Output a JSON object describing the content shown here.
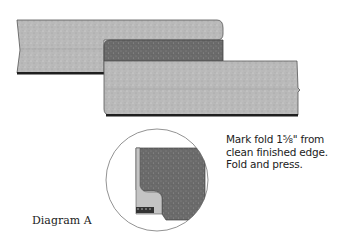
{
  "diagram": {
    "caption": "Diagram A",
    "instruction_lines": [
      "Mark fold 1⅝\" from",
      "clean finished edge.",
      "Fold and press."
    ],
    "colors": {
      "fabric_light": "#b9b9b9",
      "fabric_dark": "#6a6a6a",
      "edge_dark": "#1e1e1e",
      "outline": "#555555",
      "circle_stroke": "#777777"
    },
    "elements": [
      "top-fabric-strip",
      "folded-back-dark-band",
      "lower-fabric-strip",
      "detail-magnifier-circle"
    ]
  }
}
